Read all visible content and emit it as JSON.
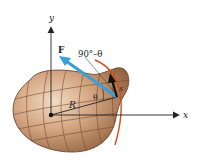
{
  "diagram": {
    "type": "physics-torque-diagram",
    "labels": {
      "y_axis": "y",
      "x_axis": "x",
      "force": "F",
      "angle_complement": "90°–θ",
      "angle": "θ",
      "radius": "R",
      "arc_length": "s"
    },
    "colors": {
      "body_fill": "#b98560",
      "body_light": "#e3c3a6",
      "body_grid": "#7a4a2c",
      "force_arrow": "#3a9fd6",
      "tangent_arrow": "#111111",
      "arc": "#d84a1e",
      "axes": "#222222"
    }
  }
}
